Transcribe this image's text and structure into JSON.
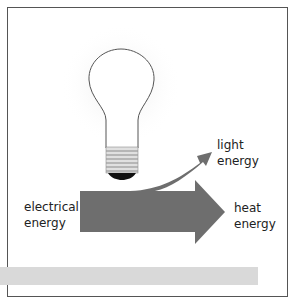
{
  "diagram": {
    "input_label_line1": "electrical",
    "input_label_line2": "energy",
    "output_light_line1": "light",
    "output_light_line2": "energy",
    "output_heat_line1": "heat",
    "output_heat_line2": "energy",
    "arrow_color": "#6e6e6e",
    "bulb_icon": "light-bulb-icon"
  }
}
